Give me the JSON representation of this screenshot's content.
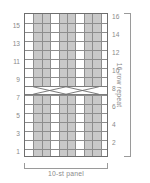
{
  "chart_data": {
    "type": "table",
    "title": "",
    "subtitle": "",
    "kind": "knitting-cable-chart",
    "columns": 10,
    "rows": 16,
    "xlabel": "10-st panel",
    "ylabel": "16-row repeat",
    "grid": true,
    "legend_position": "none",
    "left_axis_label": "odd rows (RS)",
    "right_axis_label": "even rows (WS)",
    "left_row_numbers": [
      15,
      13,
      11,
      9,
      7,
      5,
      3,
      1
    ],
    "right_row_numbers": [
      16,
      14,
      12,
      10,
      8,
      6,
      4,
      2
    ],
    "xlim": [
      0,
      10
    ],
    "ylim": [
      0,
      16
    ],
    "shaded_columns": [
      2,
      3,
      5,
      6,
      8,
      9
    ],
    "unshaded_columns": [
      1,
      4,
      7,
      10
    ],
    "cable_crossings": [
      {
        "row": 8,
        "start_column": 2,
        "end_column": 5,
        "type": "cable-cross"
      },
      {
        "row": 8,
        "start_column": 6,
        "end_column": 9,
        "type": "cable-cross"
      }
    ],
    "cell_values": [
      [
        "",
        "p",
        "p",
        "",
        "p",
        "p",
        "",
        "p",
        "p",
        ""
      ],
      [
        "",
        "p",
        "p",
        "",
        "p",
        "p",
        "",
        "p",
        "p",
        ""
      ],
      [
        "",
        "p",
        "p",
        "",
        "p",
        "p",
        "",
        "p",
        "p",
        ""
      ],
      [
        "",
        "p",
        "p",
        "",
        "p",
        "p",
        "",
        "p",
        "p",
        ""
      ],
      [
        "",
        "p",
        "p",
        "",
        "p",
        "p",
        "",
        "p",
        "p",
        ""
      ],
      [
        "",
        "p",
        "p",
        "",
        "p",
        "p",
        "",
        "p",
        "p",
        ""
      ],
      [
        "",
        "p",
        "p",
        "",
        "p",
        "p",
        "",
        "p",
        "p",
        ""
      ],
      [
        "",
        "x",
        "x",
        "x",
        "x",
        "x",
        "x",
        "x",
        "x",
        ""
      ],
      [
        "",
        "p",
        "p",
        "",
        "p",
        "p",
        "",
        "p",
        "p",
        ""
      ],
      [
        "",
        "p",
        "p",
        "",
        "p",
        "p",
        "",
        "p",
        "p",
        ""
      ],
      [
        "",
        "p",
        "p",
        "",
        "p",
        "p",
        "",
        "p",
        "p",
        ""
      ],
      [
        "",
        "p",
        "p",
        "",
        "p",
        "p",
        "",
        "p",
        "p",
        ""
      ],
      [
        "",
        "p",
        "p",
        "",
        "p",
        "p",
        "",
        "p",
        "p",
        ""
      ],
      [
        "",
        "p",
        "p",
        "",
        "p",
        "p",
        "",
        "p",
        "p",
        ""
      ],
      [
        "",
        "p",
        "p",
        "",
        "p",
        "p",
        "",
        "p",
        "p",
        ""
      ],
      [
        "",
        "p",
        "p",
        "",
        "p",
        "p",
        "",
        "p",
        "p",
        ""
      ]
    ]
  },
  "chart": {
    "row_repeat_label": "16-row repeat",
    "panel_label": "10-st panel"
  },
  "colors": {
    "shade": "#c9c9c9",
    "gridline": "#8d8d8d",
    "border": "#6e6e6e",
    "text": "#8a8a8a",
    "background": "#ffffff"
  }
}
